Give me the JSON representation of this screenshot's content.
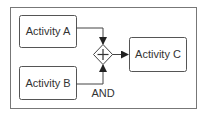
{
  "diagram": {
    "type": "BPMN parallel gateway (AND join)",
    "nodes": [
      {
        "id": "a",
        "label": "Activity A"
      },
      {
        "id": "b",
        "label": "Activity B"
      },
      {
        "id": "c",
        "label": "Activity C"
      }
    ],
    "gateway": {
      "symbol": "+",
      "label": "AND"
    },
    "edges": [
      {
        "from": "Activity A",
        "to": "AND gateway"
      },
      {
        "from": "Activity B",
        "to": "AND gateway"
      },
      {
        "from": "AND gateway",
        "to": "Activity C"
      }
    ],
    "colors": {
      "stroke": "#555555",
      "text": "#333333",
      "background": "#ffffff"
    }
  }
}
